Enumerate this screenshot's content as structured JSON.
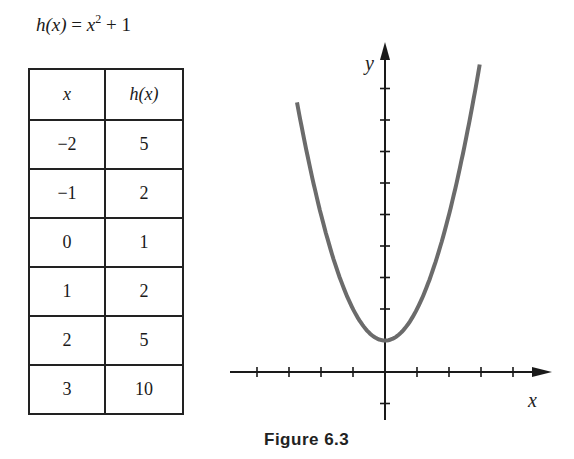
{
  "formula": {
    "lhs": "h(x)",
    "rhs_base": "x",
    "rhs_exp": "2",
    "rhs_tail": " + 1",
    "text": "h(x) = x² + 1"
  },
  "table": {
    "headers": [
      "x",
      "h(x)"
    ],
    "rows": [
      [
        "−2",
        "5"
      ],
      [
        "−1",
        "2"
      ],
      [
        "0",
        "1"
      ],
      [
        "1",
        "2"
      ],
      [
        "2",
        "5"
      ],
      [
        "3",
        "10"
      ]
    ]
  },
  "caption": "Figure 6.3",
  "chart_data": {
    "type": "line",
    "function": "x^2 + 1",
    "xlabel": "x",
    "ylabel": "y",
    "x": [
      -2.8,
      -2,
      -1,
      0,
      1,
      2,
      2.8
    ],
    "values": [
      8.84,
      5,
      2,
      1,
      2,
      5,
      8.84
    ],
    "table_points": {
      "x": [
        -2,
        -1,
        0,
        1,
        2,
        3
      ],
      "y": [
        5,
        2,
        1,
        2,
        5,
        10
      ]
    },
    "x_ticks": [
      -4,
      -3,
      -2,
      -1,
      1,
      2,
      3,
      4
    ],
    "y_ticks": [
      -1,
      1,
      2,
      3,
      4,
      5,
      6,
      7,
      8,
      9
    ],
    "xlim": [
      -4.8,
      5.2
    ],
    "ylim": [
      -1.7,
      10
    ],
    "grid": false,
    "legend": "none",
    "curve_color": "#6b6b6b",
    "axis_color": "#1a1a1a"
  }
}
